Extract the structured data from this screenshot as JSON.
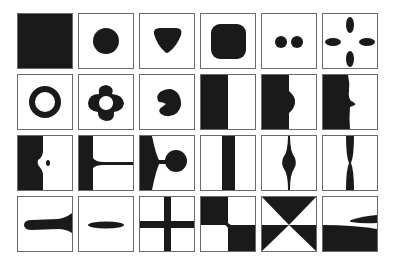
{
  "figure": {
    "rows": 4,
    "columns": 6,
    "fill_color": "#1a1a1a",
    "border_color": "#6a6a6a",
    "background": "#ffffff",
    "cells": [
      {
        "row": 1,
        "col": 1,
        "shape": "filled-square"
      },
      {
        "row": 1,
        "col": 2,
        "shape": "circle"
      },
      {
        "row": 1,
        "col": 3,
        "shape": "rounded-triangle"
      },
      {
        "row": 1,
        "col": 4,
        "shape": "rounded-square"
      },
      {
        "row": 1,
        "col": 5,
        "shape": "two-dots"
      },
      {
        "row": 1,
        "col": 6,
        "shape": "four-petals"
      },
      {
        "row": 2,
        "col": 1,
        "shape": "ring"
      },
      {
        "row": 2,
        "col": 2,
        "shape": "lobed-ring"
      },
      {
        "row": 2,
        "col": 3,
        "shape": "notched-blob"
      },
      {
        "row": 2,
        "col": 4,
        "shape": "half-plane"
      },
      {
        "row": 2,
        "col": 5,
        "shape": "half-plane-bump"
      },
      {
        "row": 2,
        "col": 6,
        "shape": "half-plane-step"
      },
      {
        "row": 3,
        "col": 1,
        "shape": "half-plane-dent-with-dot"
      },
      {
        "row": 3,
        "col": 2,
        "shape": "plane-with-thin-filament"
      },
      {
        "row": 3,
        "col": 3,
        "shape": "plane-with-neck-and-bulb"
      },
      {
        "row": 3,
        "col": 4,
        "shape": "vertical-stripe"
      },
      {
        "row": 3,
        "col": 5,
        "shape": "vertical-line-with-bulge"
      },
      {
        "row": 3,
        "col": 6,
        "shape": "pinched-vertical-stripe"
      },
      {
        "row": 4,
        "col": 1,
        "shape": "horizontal-tongue"
      },
      {
        "row": 4,
        "col": 2,
        "shape": "horizontal-ellipse"
      },
      {
        "row": 4,
        "col": 3,
        "shape": "cross"
      },
      {
        "row": 4,
        "col": 4,
        "shape": "checker-quadrants"
      },
      {
        "row": 4,
        "col": 5,
        "shape": "hourglass-bowtie"
      },
      {
        "row": 4,
        "col": 6,
        "shape": "split-plane-with-wedge"
      }
    ]
  }
}
